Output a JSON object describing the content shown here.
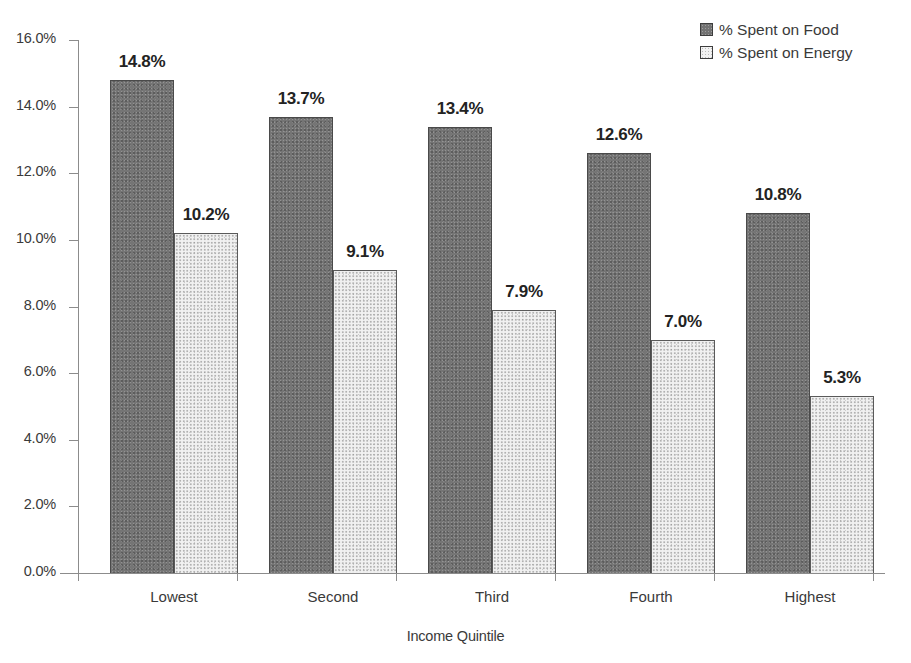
{
  "chart_data": {
    "type": "bar",
    "title": "",
    "xlabel": "Income Quintile",
    "ylabel": "",
    "categories": [
      "Lowest",
      "Second",
      "Third",
      "Fourth",
      "Highest"
    ],
    "series": [
      {
        "name": "% Spent on Food",
        "values": [
          14.8,
          13.7,
          13.4,
          12.6,
          10.8
        ],
        "labels": [
          "14.8%",
          "13.7%",
          "13.4%",
          "12.6%",
          "10.8%"
        ],
        "color": "#757575",
        "swatch": "swatch-food"
      },
      {
        "name": "% Spent on Energy",
        "values": [
          10.2,
          9.1,
          7.9,
          7.0,
          5.3
        ],
        "labels": [
          "10.2%",
          "9.1%",
          "7.9%",
          "7.0%",
          "5.3%"
        ],
        "color": "#f1f1f1",
        "swatch": "swatch-energy"
      }
    ],
    "ylim": [
      0,
      16
    ],
    "ytick_values": [
      16.0,
      14.0,
      12.0,
      10.0,
      8.0,
      6.0,
      4.0,
      2.0,
      0.0
    ],
    "ytick_labels": [
      "16.0%",
      "14.0%",
      "12.0%",
      "10.0%",
      "8.0%",
      "6.0%",
      "4.0%",
      "2.0%",
      "0.0%"
    ],
    "grid": false,
    "legend_position": "top-right",
    "axis_color": "#8c8c8c",
    "label_color": "#232323"
  },
  "legend": {
    "entries": [
      {
        "label": "% Spent on Food"
      },
      {
        "label": "% Spent on Energy"
      }
    ]
  },
  "axis": {
    "x_title": "Income Quintile"
  }
}
